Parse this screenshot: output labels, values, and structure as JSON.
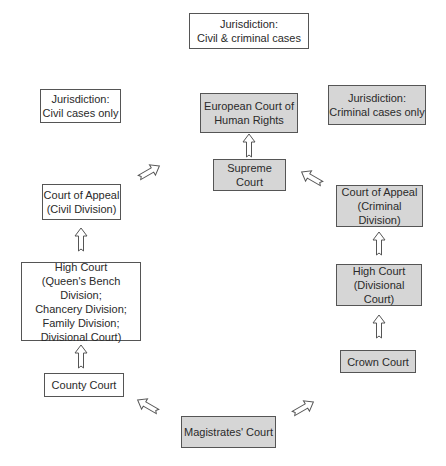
{
  "legend": {
    "both": "Jurisdiction:\nCivil & criminal cases",
    "civil": "Jurisdiction:\nCivil cases only",
    "criminal": "Jurisdiction:\nCriminal cases only"
  },
  "courts": {
    "echr": "European Court of\nHuman Rights",
    "supreme": "Supreme Court",
    "appeal_civil": "Court of Appeal\n(Civil Division)",
    "high_civil": "High Court\n(Queen's Bench Division;\nChancery Division;\nFamily Division;\nDivisional Court)",
    "county": "County Court",
    "appeal_criminal": "Court of Appeal\n(Criminal Division)",
    "high_criminal": "High Court\n(Divisional Court)",
    "crown": "Crown Court",
    "magistrates": "Magistrates' Court"
  },
  "colors": {
    "civil_fill": "#ffffff",
    "criminal_fill": "#d6d6d6",
    "border": "#555555"
  }
}
